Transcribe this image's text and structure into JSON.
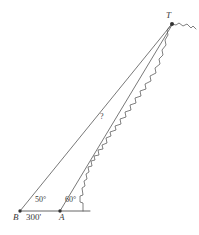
{
  "diagram": {
    "type": "trigonometry-triangle-elevation",
    "stroke_color": "#555555",
    "label_color": "#3a3a3a",
    "background_color": "#ffffff",
    "points": [
      {
        "id": "B",
        "label": "B",
        "x": 20,
        "y": 211,
        "marker": "dot"
      },
      {
        "id": "A",
        "label": "A",
        "x": 60,
        "y": 211,
        "marker": "dot"
      },
      {
        "id": "T",
        "label": "T",
        "x": 172,
        "y": 23,
        "marker": "dot"
      }
    ],
    "labels": {
      "point_b": "B",
      "point_a": "A",
      "point_t": "T",
      "baseline_distance": "300'",
      "unknown_distance": "?",
      "angle_at_b": "50°",
      "angle_at_a": "60°"
    },
    "measurements": {
      "baseline_BA": 300,
      "baseline_units": "feet",
      "angle_B_degrees": 50,
      "angle_A_degrees": 60,
      "unknown_segment": "AT"
    },
    "segments": [
      {
        "name": "baseline",
        "from": "B",
        "to": "ground-right",
        "style": "solid"
      },
      {
        "name": "line-of-sight-B",
        "from": "B",
        "to": "T",
        "style": "solid"
      },
      {
        "name": "line-of-sight-A",
        "from": "A",
        "to": "T",
        "style": "solid"
      }
    ],
    "terrain": {
      "name": "mountain-profile",
      "description": "jagged hillside rising from the ground near A up to the peak at T"
    }
  }
}
